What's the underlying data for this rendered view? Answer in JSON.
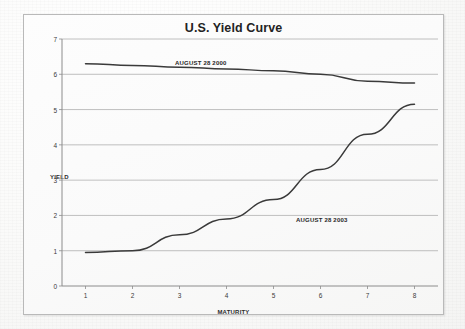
{
  "chart": {
    "title": "U.S. Yield Curve",
    "y_axis_title": "YIELD",
    "x_axis_title": "MATURITY"
  },
  "annotations": {
    "series_2000_label": "AUGUST 28 2000",
    "series_2003_label": "AUGUST 28 2003"
  },
  "colors": {
    "line": "#3a3a3a",
    "grid": "#b0b0b0",
    "axis": "#8c8c8c",
    "title_text": "#232323",
    "paper": "#fafafa"
  },
  "chart_data": {
    "type": "line",
    "title": "U.S. Yield Curve",
    "xlabel": "MATURITY",
    "ylabel": "YIELD",
    "xlim": [
      0.5,
      8.5
    ],
    "ylim": [
      0,
      7
    ],
    "grid": true,
    "legend": "inline-annotations",
    "x": [
      1,
      2,
      3,
      4,
      5,
      6,
      7,
      8
    ],
    "xticks": [
      "1",
      "2",
      "3",
      "4",
      "5",
      "6",
      "7",
      "8"
    ],
    "yticks": [
      "0",
      "1",
      "2",
      "3",
      "4",
      "5",
      "6",
      "7"
    ],
    "series": [
      {
        "name": "AUGUST 28 2000",
        "values": [
          6.3,
          6.25,
          6.2,
          6.15,
          6.1,
          6.0,
          5.8,
          5.75
        ]
      },
      {
        "name": "AUGUST 28 2003",
        "values": [
          0.95,
          1.0,
          1.45,
          1.9,
          2.45,
          3.3,
          4.3,
          5.15
        ]
      }
    ]
  }
}
